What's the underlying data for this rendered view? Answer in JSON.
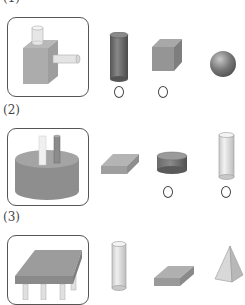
{
  "problems": [
    {
      "label": "(1)",
      "composite": "cube with two small cylinders",
      "options": [
        {
          "shape": "cylinder",
          "color": "#6e6e6e",
          "marked": true,
          "mark": "○"
        },
        {
          "shape": "cube",
          "color": "#9a9a9a",
          "marked": true,
          "mark": "○"
        },
        {
          "shape": "sphere",
          "color": "#7a7a7a",
          "marked": false,
          "mark": ""
        }
      ]
    },
    {
      "label": "(2)",
      "composite": "large short cylinder with two thin rods",
      "options": [
        {
          "shape": "rectangular-slab",
          "color": "#a8a8a8",
          "marked": false,
          "mark": ""
        },
        {
          "shape": "short-cylinder",
          "color": "#777777",
          "marked": true,
          "mark": "○"
        },
        {
          "shape": "tall-cylinder",
          "color": "#d8d8d8",
          "marked": true,
          "mark": "○"
        }
      ]
    },
    {
      "label": "(3)",
      "composite": "table: rectangular slab on cylinder legs",
      "options": [
        {
          "shape": "tall-cylinder",
          "color": "#d8d8d8",
          "marked": false,
          "mark": ""
        },
        {
          "shape": "rectangular-slab",
          "color": "#a8a8a8",
          "marked": false,
          "mark": ""
        },
        {
          "shape": "pyramid",
          "color": "#d0d0d0",
          "marked": false,
          "mark": ""
        }
      ]
    }
  ],
  "colors": {
    "border": "#555555",
    "ring": "#444444",
    "background": "#ffffff"
  }
}
